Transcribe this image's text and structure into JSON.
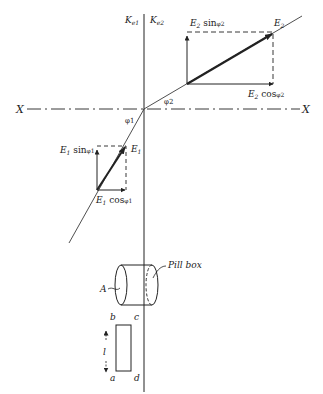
{
  "figure": {
    "type": "refraction-of-electric-field-diagram",
    "labels": {
      "k1": {
        "main": "K",
        "sub": "e1"
      },
      "k2": {
        "main": "K",
        "sub": "e2"
      },
      "x_left": "X",
      "x_right": "X",
      "phi1": "φ1",
      "phi2": "φ2",
      "e1": {
        "main": "E",
        "sub": "1"
      },
      "e2": {
        "main": "E",
        "sub": "2"
      },
      "e1_sin": {
        "main": "E",
        "sub": "1",
        "func": " sin",
        "angle": "φ1"
      },
      "e1_cos": {
        "main": "E",
        "sub": "1",
        "func": " cos",
        "angle": "φ1"
      },
      "e2_sin": {
        "main": "E",
        "sub": "2",
        "func": " sin",
        "angle": "φ2"
      },
      "e2_cos": {
        "main": "E",
        "sub": "2",
        "func": " cos",
        "angle": "φ2"
      },
      "pillbox": "Pill box",
      "area": "A",
      "corner_a": "a",
      "corner_b": "b",
      "corner_c": "c",
      "corner_d": "d",
      "length": "l"
    },
    "colors": {
      "ink": "#222222",
      "background": "#ffffff"
    }
  }
}
